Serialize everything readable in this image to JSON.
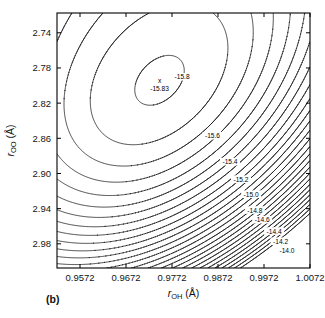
{
  "panel": {
    "label": "(b)"
  },
  "chart_data": {
    "type": "contour",
    "title": "",
    "xlabel_parts": {
      "symbol": "r",
      "subscript": "OH",
      "unit": "(Å)"
    },
    "ylabel_parts": {
      "symbol": "r",
      "subscript": "OO",
      "unit": "(Å)"
    },
    "xlabel": "r_OH (Å)",
    "ylabel": "r_OO (Å)",
    "xlim": [
      0.9522,
      1.0072
    ],
    "ylim": [
      2.7175,
      3.0075
    ],
    "y_axis_inverted": true,
    "xticks": [
      0.9572,
      0.9672,
      0.9772,
      0.9872,
      0.9972,
      1.0072
    ],
    "xticklabels": [
      "0.9572",
      "0.9672",
      "0.9772",
      "0.9872",
      "0.9972",
      "1.0072"
    ],
    "yticks": [
      2.74,
      2.78,
      2.82,
      2.86,
      2.9,
      2.94,
      2.98
    ],
    "yticklabels": [
      "2.74",
      "2.78",
      "2.82",
      "2.86",
      "2.90",
      "2.94",
      "2.98"
    ],
    "grid": false,
    "legend": false,
    "zlabel": "energy",
    "levels": [
      -15.8,
      -15.6,
      -15.4,
      -15.2,
      -15.0,
      -14.8,
      -14.6,
      -14.4,
      -14.2,
      -14.0,
      -13.8,
      -13.6,
      -13.4,
      -13.2,
      -13.0,
      -12.8,
      -12.6,
      -12.4,
      -12.2,
      -12.0,
      -11.8,
      -11.6,
      -11.4,
      -11.2,
      -11.0,
      -10.8,
      -10.6
    ],
    "labeled_levels": [
      {
        "value": -15.8,
        "text": "-15.8",
        "x": 0.9794,
        "y": 2.7905
      },
      {
        "value": -15.6,
        "text": "-15.6",
        "x": 0.986,
        "y": 2.8575
      },
      {
        "value": -15.4,
        "text": "-15.4",
        "x": 0.9898,
        "y": 2.887
      },
      {
        "value": -15.2,
        "text": "-15.2",
        "x": 0.9922,
        "y": 2.907
      },
      {
        "value": -15.0,
        "text": "-15.0",
        "x": 0.9944,
        "y": 2.924
      },
      {
        "value": -14.8,
        "text": "-14.8",
        "x": 0.9952,
        "y": 2.942
      },
      {
        "value": -14.6,
        "text": "-14.6",
        "x": 0.9968,
        "y": 2.953
      },
      {
        "value": -14.4,
        "text": "-14.4",
        "x": 0.9994,
        "y": 2.966
      },
      {
        "value": -14.2,
        "text": "-14.2",
        "x": 1.0008,
        "y": 2.9775
      },
      {
        "value": -14.0,
        "text": "-14.0",
        "x": 1.0022,
        "y": 2.988
      }
    ],
    "minimum": {
      "marker": "x",
      "value": -15.83,
      "label": "-15.83",
      "x": 0.9745,
      "y": 2.795
    },
    "surface_model": {
      "description": "anisotropic rotated quadratic-with-anharmonic well used to render the contour field",
      "z_min": -15.83,
      "cx": 0.9745,
      "cy": 2.795,
      "theta_deg": 34.0,
      "a_scale": 0.0142,
      "b_scale": 0.064,
      "anharmonic": 0.33
    },
    "style": {
      "line_color": "#1a1a1a",
      "line_width": 0.8,
      "background": "#ffffff",
      "frame_color": "#000000"
    }
  },
  "plot_box": {
    "left": 57,
    "top": 13,
    "right": 310,
    "bottom": 268
  }
}
